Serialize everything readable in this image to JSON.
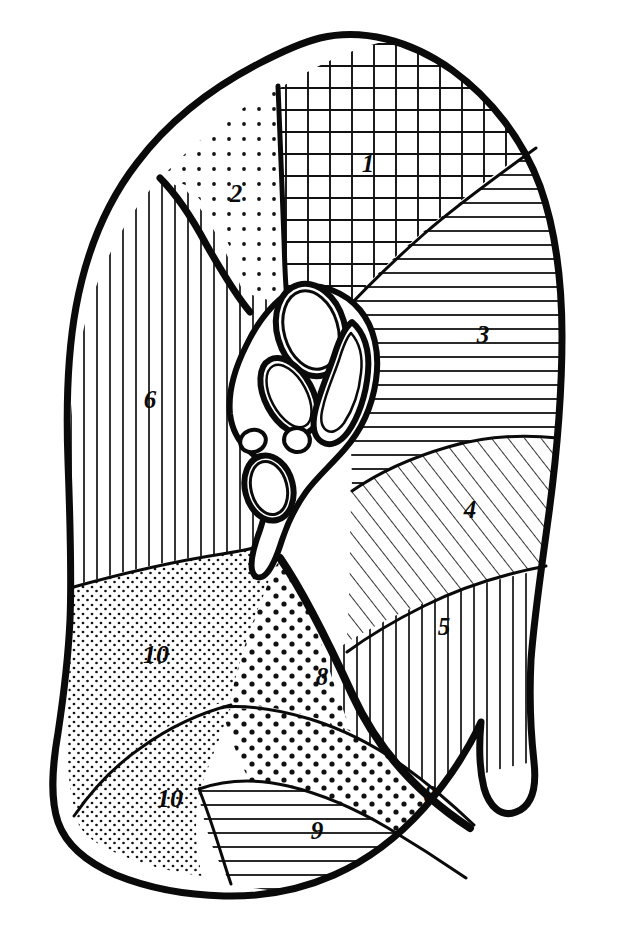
{
  "figure": {
    "kind": "anatomical-line-diagram",
    "background_color": "#ffffff",
    "ink_color": "#0a0a0a",
    "outline_stroke_width": 6,
    "hatch_stroke_width": 1.5
  },
  "segments": [
    {
      "id": "seg-1",
      "label": "1",
      "pattern": "cross-hatch-grid",
      "label_x": 368,
      "label_y": 166
    },
    {
      "id": "seg-2",
      "label": "2",
      "pattern": "dot-grid-medium",
      "label_x": 236,
      "label_y": 196
    },
    {
      "id": "seg-3",
      "label": "3",
      "pattern": "horizontal-lines",
      "label_x": 483,
      "label_y": 337
    },
    {
      "id": "seg-4",
      "label": "4",
      "pattern": "diagonal-hatch",
      "label_x": 470,
      "label_y": 512
    },
    {
      "id": "seg-5",
      "label": "5",
      "pattern": "vertical-lines",
      "label_x": 444,
      "label_y": 629
    },
    {
      "id": "seg-6",
      "label": "6",
      "pattern": "vertical-lines",
      "label_x": 150,
      "label_y": 402
    },
    {
      "id": "seg-8a",
      "label": "8",
      "pattern": "dot-coarse",
      "label_x": 322,
      "label_y": 679
    },
    {
      "id": "seg-8b",
      "label": "8",
      "pattern": "dot-coarse",
      "label_x": 430,
      "label_y": 797
    },
    {
      "id": "seg-9",
      "label": "9",
      "pattern": "horizontal-lines",
      "label_x": 317,
      "label_y": 833
    },
    {
      "id": "seg-10a",
      "label": "10",
      "pattern": "stipple-fine",
      "label_x": 156,
      "label_y": 657
    },
    {
      "id": "seg-10b",
      "label": "10",
      "pattern": "stipple-fine",
      "label_x": 170,
      "label_y": 801
    }
  ],
  "hilum": {
    "name": "hilum-structures",
    "elements": [
      {
        "id": "hilum-oval-upper",
        "shape": "oval",
        "cx": 311,
        "cy": 330
      },
      {
        "id": "hilum-oval-middle",
        "shape": "oval",
        "cx": 288,
        "cy": 395
      },
      {
        "id": "hilum-tube-curved",
        "shape": "curved-tube",
        "cx": 337,
        "cy": 385
      },
      {
        "id": "hilum-circle-small-left",
        "shape": "circle",
        "cx": 253,
        "cy": 440
      },
      {
        "id": "hilum-circle-small-right",
        "shape": "circle",
        "cx": 296,
        "cy": 440
      },
      {
        "id": "hilum-oval-lower",
        "shape": "oval",
        "cx": 268,
        "cy": 487
      }
    ]
  }
}
